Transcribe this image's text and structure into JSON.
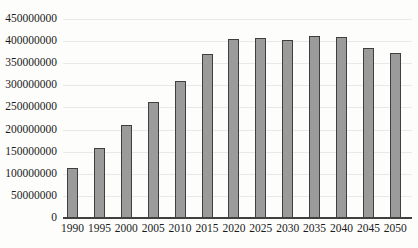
{
  "chart_data": {
    "type": "bar",
    "title": "",
    "xlabel": "",
    "ylabel": "",
    "categories": [
      "1990",
      "1995",
      "2000",
      "2005",
      "2010",
      "2015",
      "2020",
      "2025",
      "2030",
      "2035",
      "2040",
      "2045",
      "2050"
    ],
    "values": [
      114000000,
      159000000,
      210000000,
      262000000,
      310000000,
      370000000,
      404000000,
      408000000,
      402000000,
      412000000,
      410000000,
      385000000,
      374000000
    ],
    "ylim": [
      0,
      450000000
    ],
    "ytick_step": 50000000,
    "ytick_labels": [
      "0",
      "50000000",
      "100000000",
      "150000000",
      "200000000",
      "250000000",
      "300000000",
      "350000000",
      "400000000",
      "450000000"
    ],
    "grid": true,
    "legend": "none",
    "colors": {
      "bar_fill": "#9b9b9b",
      "bar_border": "#3f3f3f",
      "axis_line": "#404040",
      "gridline": "#e9e9e9",
      "tick_text": "#1b1b1b",
      "background": "#fdfdfc"
    }
  }
}
